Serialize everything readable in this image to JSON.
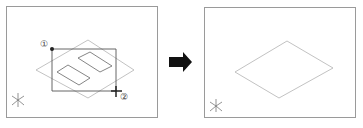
{
  "before_view": {
    "name": "before-selection",
    "point_labels": {
      "first": "①",
      "second": "②"
    },
    "colors": {
      "frame": "#9a9a9a",
      "shape": "#b0b0b0",
      "selection": "#555555",
      "marker": "#222222"
    }
  },
  "transition": {
    "icon": "right-arrow",
    "color": "#111111"
  },
  "after_view": {
    "name": "after-deletion",
    "colors": {
      "frame": "#9a9a9a",
      "shape": "#b0b0b0"
    }
  },
  "ucs_icon": {
    "type": "isometric-axes"
  }
}
